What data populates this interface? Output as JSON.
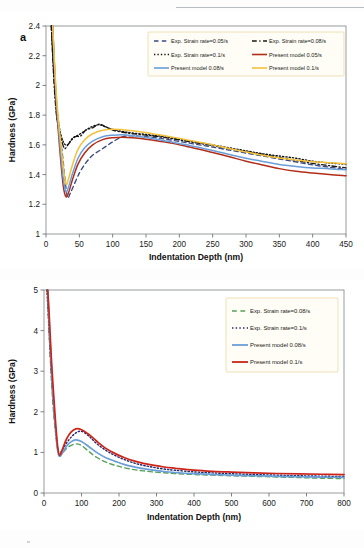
{
  "figure": {
    "panels": [
      {
        "tag": "a",
        "axis_x_title": "Indentation Depth (nm)",
        "axis_y_title": "Hardness (GPa)"
      },
      {
        "tag": "b",
        "axis_x_title": "Indentation Depth (nm)",
        "axis_y_title": "Hardness (GPa)"
      }
    ]
  },
  "chart_data": [
    {
      "type": "line",
      "panel": "a",
      "title": "",
      "xlabel": "Indentation Depth (nm)",
      "ylabel": "Hardness (GPa)",
      "xlim": [
        0,
        450
      ],
      "ylim": [
        1,
        2.4
      ],
      "xticks": [
        0,
        50,
        100,
        150,
        200,
        250,
        300,
        350,
        400,
        450
      ],
      "yticks": [
        "1",
        "1.2",
        "1.4",
        "1.6",
        "1.8",
        "2",
        "2.2",
        "2.4"
      ],
      "grid": false,
      "legend_position": "top-right",
      "series": [
        {
          "name": "Exp. Strain rate=0.05/s",
          "style": "dashed",
          "color": "#3b4a86",
          "x": [
            8,
            12,
            16,
            20,
            24,
            28,
            32,
            36,
            40,
            50,
            60,
            70,
            80,
            90,
            100,
            115,
            130,
            150,
            170,
            190,
            210,
            230,
            250,
            275,
            300,
            325,
            350,
            375,
            400,
            425,
            450
          ],
          "y": [
            2.4,
            2.05,
            1.8,
            1.66,
            1.56,
            1.39,
            1.25,
            1.27,
            1.31,
            1.41,
            1.48,
            1.53,
            1.56,
            1.59,
            1.62,
            1.655,
            1.66,
            1.655,
            1.645,
            1.63,
            1.615,
            1.6,
            1.585,
            1.565,
            1.545,
            1.525,
            1.505,
            1.485,
            1.465,
            1.45,
            1.435
          ]
        },
        {
          "name": "Exp. Strain rate=0.08/s",
          "style": "dashdot",
          "color": "#1a1a1a",
          "x": [
            8,
            12,
            16,
            20,
            24,
            28,
            32,
            38,
            44,
            52,
            60,
            70,
            80,
            90,
            100,
            115,
            130,
            150,
            170,
            190,
            210,
            230,
            250,
            275,
            300,
            325,
            350,
            375,
            400,
            425,
            450
          ],
          "y": [
            2.4,
            2.02,
            1.79,
            1.7,
            1.62,
            1.575,
            1.595,
            1.63,
            1.655,
            1.66,
            1.7,
            1.715,
            1.74,
            1.72,
            1.7,
            1.685,
            1.675,
            1.665,
            1.655,
            1.64,
            1.625,
            1.61,
            1.595,
            1.575,
            1.555,
            1.535,
            1.515,
            1.495,
            1.475,
            1.46,
            1.445
          ]
        },
        {
          "name": "Exp. Strain rate=0.1/s",
          "style": "dotted",
          "color": "#111111",
          "x": [
            8,
            14,
            20,
            26,
            32,
            40,
            50,
            60,
            70,
            80,
            90,
            100,
            115,
            130,
            150,
            170,
            190,
            210,
            230,
            250,
            275,
            300,
            325,
            350,
            375,
            400,
            425,
            450
          ],
          "y": [
            2.4,
            1.95,
            1.72,
            1.62,
            1.6,
            1.645,
            1.67,
            1.7,
            1.725,
            1.735,
            1.72,
            1.705,
            1.69,
            1.68,
            1.67,
            1.66,
            1.645,
            1.63,
            1.615,
            1.6,
            1.58,
            1.56,
            1.54,
            1.525,
            1.51,
            1.49,
            1.478,
            1.47
          ]
        },
        {
          "name": "Present model 0.05/s",
          "style": "solid",
          "color": "#b32c18",
          "x": [
            10,
            14,
            18,
            22,
            26,
            30,
            34,
            40,
            48,
            58,
            70,
            85,
            100,
            115,
            130,
            150,
            170,
            190,
            210,
            230,
            250,
            275,
            300,
            325,
            350,
            375,
            400,
            425,
            450
          ],
          "y": [
            2.4,
            2.0,
            1.72,
            1.5,
            1.32,
            1.25,
            1.28,
            1.37,
            1.47,
            1.545,
            1.6,
            1.635,
            1.648,
            1.652,
            1.648,
            1.638,
            1.625,
            1.61,
            1.59,
            1.57,
            1.548,
            1.52,
            1.49,
            1.465,
            1.44,
            1.422,
            1.41,
            1.4,
            1.392
          ]
        },
        {
          "name": "Present model 0.08/s",
          "style": "solid",
          "color": "#6a9ed8",
          "x": [
            10,
            14,
            18,
            22,
            26,
            30,
            34,
            40,
            48,
            58,
            70,
            85,
            100,
            115,
            130,
            150,
            170,
            190,
            210,
            230,
            250,
            275,
            300,
            325,
            350,
            375,
            400,
            425,
            450
          ],
          "y": [
            2.4,
            2.02,
            1.76,
            1.55,
            1.37,
            1.285,
            1.32,
            1.41,
            1.51,
            1.58,
            1.625,
            1.655,
            1.665,
            1.668,
            1.662,
            1.65,
            1.635,
            1.618,
            1.6,
            1.582,
            1.562,
            1.535,
            1.51,
            1.488,
            1.468,
            1.455,
            1.445,
            1.44,
            1.432
          ]
        },
        {
          "name": "Present model 0.1/s",
          "style": "solid",
          "color": "#f2c23c",
          "x": [
            10,
            14,
            18,
            22,
            26,
            30,
            34,
            40,
            48,
            58,
            70,
            85,
            100,
            115,
            130,
            150,
            170,
            190,
            210,
            230,
            250,
            275,
            300,
            325,
            350,
            375,
            400,
            425,
            450
          ],
          "y": [
            2.4,
            2.05,
            1.8,
            1.62,
            1.45,
            1.335,
            1.375,
            1.47,
            1.57,
            1.635,
            1.675,
            1.698,
            1.705,
            1.702,
            1.695,
            1.682,
            1.668,
            1.652,
            1.635,
            1.618,
            1.6,
            1.575,
            1.552,
            1.53,
            1.512,
            1.498,
            1.487,
            1.48,
            1.472
          ]
        }
      ]
    },
    {
      "type": "line",
      "panel": "b",
      "title": "",
      "xlabel": "Indentation Depth (nm)",
      "ylabel": "Hardness (GPa)",
      "xlim": [
        0,
        800
      ],
      "ylim": [
        0,
        5
      ],
      "xticks": [
        0,
        100,
        200,
        300,
        400,
        500,
        600,
        700,
        800
      ],
      "yticks": [
        "0",
        "1",
        "2",
        "3",
        "4",
        "5"
      ],
      "grid": false,
      "legend_position": "top-right",
      "series": [
        {
          "name": "Exp. Strain rate=0.08/s",
          "style": "dashed",
          "color": "#57a05a",
          "x": [
            8,
            12,
            16,
            20,
            25,
            30,
            35,
            40,
            48,
            58,
            70,
            85,
            100,
            120,
            140,
            165,
            190,
            215,
            240,
            265,
            290,
            320,
            350,
            400,
            450,
            500,
            560,
            620,
            680,
            740,
            800
          ],
          "y": [
            5.0,
            4.25,
            3.45,
            2.75,
            2.05,
            1.55,
            1.15,
            0.92,
            0.97,
            1.08,
            1.16,
            1.21,
            1.17,
            1.02,
            0.88,
            0.76,
            0.68,
            0.62,
            0.575,
            0.545,
            0.52,
            0.5,
            0.48,
            0.455,
            0.44,
            0.425,
            0.41,
            0.395,
            0.38,
            0.365,
            0.355
          ]
        },
        {
          "name": "Exp. Strain rate=0.1/s",
          "style": "dotted",
          "color": "#252a6b",
          "x": [
            8,
            12,
            16,
            20,
            25,
            30,
            35,
            40,
            48,
            58,
            70,
            85,
            100,
            120,
            140,
            165,
            190,
            215,
            240,
            265,
            290,
            320,
            350,
            400,
            450,
            500,
            560,
            620,
            680,
            740,
            800
          ],
          "y": [
            5.0,
            4.3,
            3.55,
            2.9,
            2.2,
            1.65,
            1.2,
            0.95,
            1.05,
            1.2,
            1.35,
            1.48,
            1.52,
            1.4,
            1.22,
            1.05,
            0.92,
            0.82,
            0.74,
            0.68,
            0.635,
            0.59,
            0.56,
            0.52,
            0.495,
            0.475,
            0.455,
            0.44,
            0.425,
            0.415,
            0.405
          ]
        },
        {
          "name": "Present model 0.08/s",
          "style": "solid",
          "color": "#6a9ed8",
          "x": [
            10,
            14,
            18,
            22,
            27,
            32,
            37,
            42,
            50,
            60,
            72,
            85,
            100,
            120,
            140,
            165,
            190,
            215,
            240,
            265,
            290,
            320,
            350,
            400,
            450,
            500,
            560,
            620,
            680,
            740,
            800
          ],
          "y": [
            5.0,
            4.2,
            3.4,
            2.7,
            2.0,
            1.45,
            1.02,
            0.9,
            1.0,
            1.15,
            1.26,
            1.31,
            1.27,
            1.14,
            1.0,
            0.87,
            0.78,
            0.7,
            0.645,
            0.6,
            0.565,
            0.53,
            0.505,
            0.475,
            0.455,
            0.44,
            0.425,
            0.41,
            0.4,
            0.39,
            0.385
          ]
        },
        {
          "name": "Present model 0.1/s",
          "style": "solid",
          "color": "#cc2418",
          "x": [
            10,
            14,
            18,
            22,
            27,
            32,
            37,
            42,
            50,
            60,
            72,
            85,
            100,
            120,
            140,
            165,
            190,
            215,
            240,
            265,
            290,
            320,
            350,
            400,
            450,
            500,
            560,
            620,
            680,
            740,
            800
          ],
          "y": [
            5.0,
            4.35,
            3.6,
            2.95,
            2.25,
            1.6,
            1.1,
            0.93,
            1.1,
            1.33,
            1.5,
            1.58,
            1.56,
            1.44,
            1.28,
            1.1,
            0.97,
            0.87,
            0.79,
            0.73,
            0.685,
            0.64,
            0.61,
            0.565,
            0.535,
            0.515,
            0.495,
            0.48,
            0.47,
            0.462,
            0.455
          ]
        }
      ]
    }
  ]
}
